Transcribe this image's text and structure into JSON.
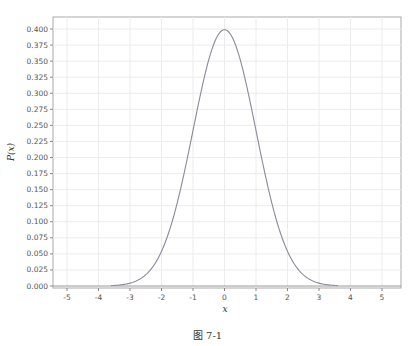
{
  "chart_data": {
    "type": "line",
    "title": "",
    "xlabel": "x",
    "ylabel": "P(x)",
    "xlim": [
      -5.5,
      5.5
    ],
    "ylim": [
      0.0,
      0.41
    ],
    "x_ticks": [
      -5,
      -4,
      -3,
      -2,
      -1,
      0,
      1,
      2,
      3,
      4,
      5
    ],
    "y_ticks": [
      "0.000",
      "0.025",
      "0.050",
      "0.075",
      "0.100",
      "0.125",
      "0.150",
      "0.175",
      "0.200",
      "0.225",
      "0.250",
      "0.275",
      "0.300",
      "0.325",
      "0.350",
      "0.375",
      "0.400"
    ],
    "grid": true,
    "legend": null,
    "series": [
      {
        "name": "Standard normal PDF",
        "x": [
          -3.6,
          -3.0,
          -2.5,
          -2.0,
          -1.5,
          -1.0,
          -0.5,
          0.0,
          0.5,
          1.0,
          1.5,
          2.0,
          2.5,
          3.0,
          3.6
        ],
        "values": [
          0.0006,
          0.0044,
          0.0175,
          0.054,
          0.1295,
          0.242,
          0.3521,
          0.3989,
          0.3521,
          0.242,
          0.1295,
          0.054,
          0.0175,
          0.0044,
          0.0006
        ],
        "color": "#8a8a9a"
      }
    ]
  },
  "caption": "图 7-1"
}
